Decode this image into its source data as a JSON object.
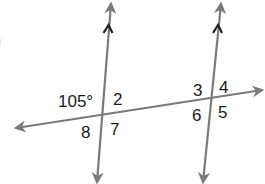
{
  "figure": {
    "partial_marker": ")",
    "line_color": "#7a7a7a",
    "parallel_mark_color": "#222222",
    "text_color": "#1a1a1a",
    "lines": {
      "transversal": {
        "x1": 16,
        "y1": 128,
        "x2": 262,
        "y2": 90
      },
      "left_parallel": {
        "x1": 111,
        "y1": 4,
        "x2": 97,
        "y2": 182
      },
      "right_parallel": {
        "x1": 221,
        "y1": 4,
        "x2": 203,
        "y2": 182
      }
    },
    "angle_labels": {
      "given": "105°",
      "a2": "2",
      "a8": "8",
      "a7": "7",
      "a3": "3",
      "a4": "4",
      "a6": "6",
      "a5": "5"
    }
  }
}
